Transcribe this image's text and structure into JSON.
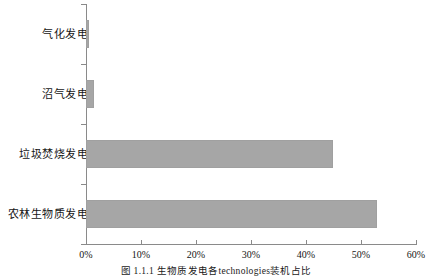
{
  "chart_data": {
    "type": "bar",
    "orientation": "horizontal",
    "title": "",
    "xlabel": "",
    "ylabel": "",
    "categories": [
      "气化发电",
      "沼气发电",
      "垃圾焚烧发电",
      "农林生物质发电"
    ],
    "values": [
      0.5,
      1.5,
      44.9,
      52.9
    ],
    "value_unit": "%",
    "xlim": [
      0,
      60
    ],
    "xticks": [
      0,
      10,
      20,
      30,
      40,
      50,
      60
    ],
    "xticklabels": [
      "0%",
      "10%",
      "20%",
      "30%",
      "40%",
      "50%",
      "60%"
    ],
    "grid": false,
    "legend": null,
    "bar_color": "#a6a6a6",
    "axis_color": "#8a8a8a"
  },
  "caption": "图 1.1.1 生物质发电各technologies装机占比",
  "colors": {
    "bar": "#a6a6a6",
    "axis": "#8a8a8a",
    "text": "#151515",
    "background": "#ffffff"
  }
}
